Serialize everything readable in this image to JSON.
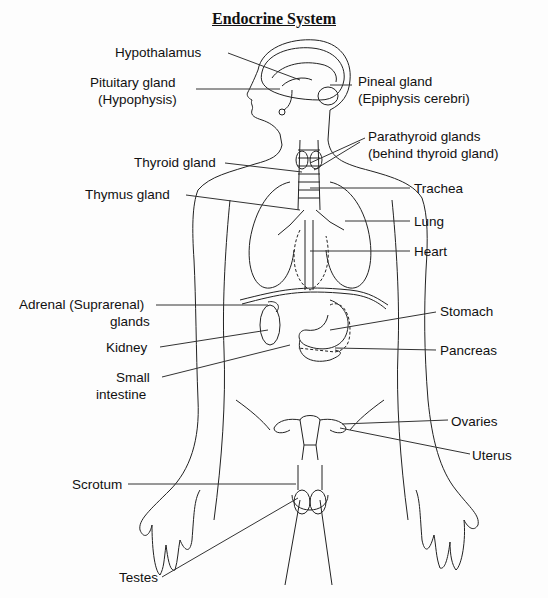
{
  "title": "Endocrine System",
  "labels": {
    "hypothalamus": "Hypothalamus",
    "pituitary_1": "Pituitary gland",
    "pituitary_2": "(Hypophysis)",
    "pineal_1": "Pineal gland",
    "pineal_2": "(Epiphysis cerebri)",
    "parathyroid_1": "Parathyroid glands",
    "parathyroid_2": "(behind thyroid gland)",
    "thyroid": "Thyroid gland",
    "thymus": "Thymus gland",
    "trachea": "Trachea",
    "lung": "Lung",
    "heart": "Heart",
    "adrenal_1": "Adrenal (Suprarenal)",
    "adrenal_2": "glands",
    "stomach": "Stomach",
    "kidney": "Kidney",
    "pancreas": "Pancreas",
    "small_intestine_1": "Small",
    "small_intestine_2": "intestine",
    "ovaries": "Ovaries",
    "uterus": "Uterus",
    "scrotum": "Scrotum",
    "testes": "Testes"
  }
}
